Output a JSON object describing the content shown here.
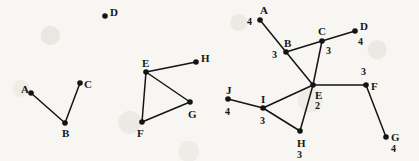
{
  "figure": {
    "background_color": "#f7f6f2",
    "ink_color": "#141414",
    "node_radius": 2.8,
    "edge_width": 1.5,
    "graphs": [
      {
        "id": "graph-1",
        "name": "left-graph",
        "nodes": [
          {
            "id": "A",
            "label": "A",
            "x": 31,
            "y": 93,
            "label_dx": -10,
            "label_dy": -4,
            "weight": null
          },
          {
            "id": "B",
            "label": "B",
            "x": 65,
            "y": 123,
            "label_dx": -3,
            "label_dy": 10,
            "weight": null
          },
          {
            "id": "C",
            "label": "C",
            "x": 80,
            "y": 83,
            "label_dx": 4,
            "label_dy": 1,
            "weight": null
          },
          {
            "id": "D",
            "label": "D",
            "x": 105,
            "y": 16,
            "label_dx": 5,
            "label_dy": -4,
            "weight": null
          }
        ],
        "edges": [
          {
            "from": "A",
            "to": "B"
          },
          {
            "from": "B",
            "to": "C"
          }
        ]
      },
      {
        "id": "graph-2",
        "name": "middle-graph",
        "nodes": [
          {
            "id": "E",
            "label": "E",
            "x": 146,
            "y": 72,
            "label_dx": -4,
            "label_dy": -9,
            "weight": null
          },
          {
            "id": "F",
            "label": "F",
            "x": 142,
            "y": 122,
            "label_dx": -5,
            "label_dy": 11,
            "weight": null
          },
          {
            "id": "G",
            "label": "G",
            "x": 190,
            "y": 102,
            "label_dx": -2,
            "label_dy": 12,
            "weight": null
          },
          {
            "id": "H",
            "label": "H",
            "x": 196,
            "y": 62,
            "label_dx": 5,
            "label_dy": -4,
            "weight": null
          }
        ],
        "edges": [
          {
            "from": "E",
            "to": "H"
          },
          {
            "from": "E",
            "to": "G"
          },
          {
            "from": "E",
            "to": "F"
          },
          {
            "from": "F",
            "to": "G"
          }
        ]
      },
      {
        "id": "graph-3",
        "name": "right-graph",
        "nodes": [
          {
            "id": "A",
            "label": "A",
            "x": 260,
            "y": 20,
            "label_dx": 0,
            "label_dy": -10,
            "weight": "4",
            "weight_dx": -13,
            "weight_dy": 2
          },
          {
            "id": "B",
            "label": "B",
            "x": 286,
            "y": 52,
            "label_dx": -2,
            "label_dy": -9,
            "weight": "3",
            "weight_dx": -14,
            "weight_dy": 3
          },
          {
            "id": "C",
            "label": "C",
            "x": 322,
            "y": 41,
            "label_dx": -4,
            "label_dy": -10,
            "weight": "3",
            "weight_dx": 4,
            "weight_dy": 10
          },
          {
            "id": "D",
            "label": "D",
            "x": 355,
            "y": 31,
            "label_dx": 5,
            "label_dy": -5,
            "weight": "4",
            "weight_dx": 3,
            "weight_dy": 11
          },
          {
            "id": "E",
            "label": "E",
            "x": 313,
            "y": 85,
            "label_dx": 2,
            "label_dy": 10,
            "weight": "2",
            "weight_dx": 2,
            "weight_dy": 21
          },
          {
            "id": "F",
            "label": "F",
            "x": 366,
            "y": 85,
            "label_dx": 5,
            "label_dy": 1,
            "weight": "3",
            "weight_dx": -5,
            "weight_dy": -13
          },
          {
            "id": "G",
            "label": "G",
            "x": 386,
            "y": 137,
            "label_dx": 5,
            "label_dy": 0,
            "weight": "4",
            "weight_dx": 5,
            "weight_dy": 12
          },
          {
            "id": "H",
            "label": "H",
            "x": 300,
            "y": 131,
            "label_dx": -3,
            "label_dy": 12,
            "weight": "3",
            "weight_dx": -3,
            "weight_dy": 24
          },
          {
            "id": "I",
            "label": "I",
            "x": 263,
            "y": 108,
            "label_dx": -2,
            "label_dy": -9,
            "weight": "3",
            "weight_dx": -3,
            "weight_dy": 13
          },
          {
            "id": "J",
            "label": "J",
            "x": 228,
            "y": 99,
            "label_dx": -2,
            "label_dy": -9,
            "weight": "4",
            "weight_dx": -3,
            "weight_dy": 13
          }
        ],
        "edges": [
          {
            "from": "A",
            "to": "B"
          },
          {
            "from": "B",
            "to": "C"
          },
          {
            "from": "B",
            "to": "E"
          },
          {
            "from": "C",
            "to": "D"
          },
          {
            "from": "C",
            "to": "E"
          },
          {
            "from": "E",
            "to": "F"
          },
          {
            "from": "E",
            "to": "H"
          },
          {
            "from": "E",
            "to": "I"
          },
          {
            "from": "F",
            "to": "G"
          },
          {
            "from": "I",
            "to": "H"
          },
          {
            "from": "I",
            "to": "J"
          }
        ]
      }
    ]
  }
}
